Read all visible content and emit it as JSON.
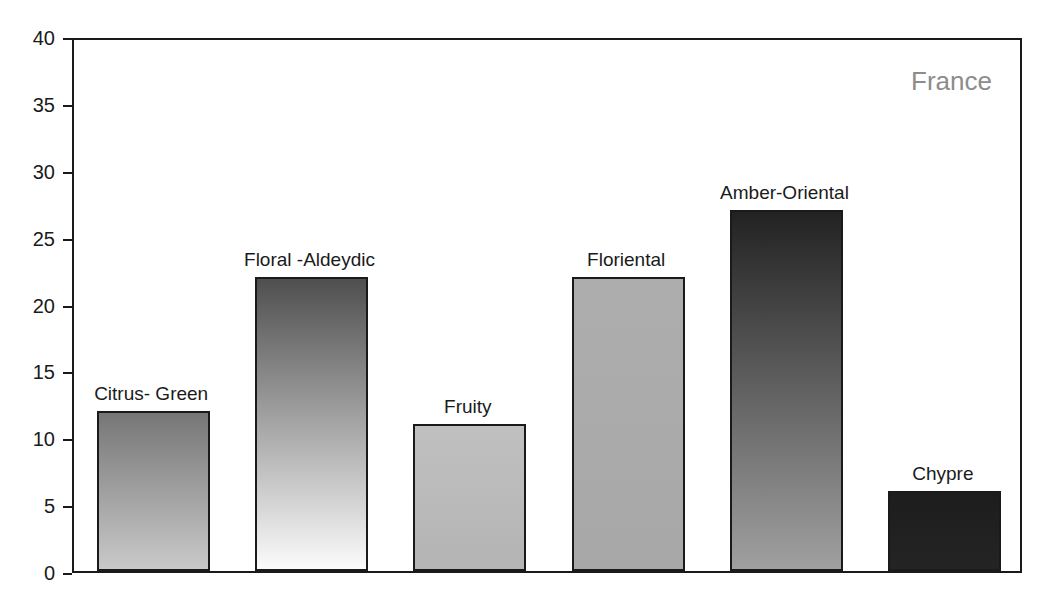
{
  "chart_data": {
    "type": "bar",
    "title": "",
    "subtitle": "",
    "annotation": "France",
    "xlabel": "",
    "ylabel": "",
    "ylim": [
      0,
      40
    ],
    "yticks": [
      0,
      5,
      10,
      15,
      20,
      25,
      30,
      35,
      40
    ],
    "ytick_labels": [
      "0",
      "5",
      "10",
      "15",
      "20",
      "25",
      "30",
      "35",
      "40"
    ],
    "grid": false,
    "legend": "none",
    "categories": [
      "Citrus- Green",
      "Floral -Aldeydic",
      "Fruity",
      "Floriental",
      "Amber-Oriental",
      "Chypre"
    ],
    "values": [
      12,
      22,
      11,
      22,
      27,
      6
    ],
    "bars": [
      {
        "label": "Citrus- Green",
        "value": 12,
        "fill_top": "#767676",
        "fill_bottom": "#c9c9c9",
        "edge": "#1a1a1a"
      },
      {
        "label": "Floral -Aldeydic",
        "value": 22,
        "fill_top": "#4f4f4f",
        "fill_bottom": "#fbfbfb",
        "edge": "#1a1a1a"
      },
      {
        "label": "Fruity",
        "value": 11,
        "fill_top": "#c0c0c0",
        "fill_bottom": "#b4b4b4",
        "edge": "#1a1a1a"
      },
      {
        "label": "Floriental",
        "value": 22,
        "fill_top": "#adadad",
        "fill_bottom": "#a8a8a8",
        "edge": "#1a1a1a"
      },
      {
        "label": "Amber-Oriental",
        "value": 27,
        "fill_top": "#222222",
        "fill_bottom": "#a0a0a0",
        "edge": "#1a1a1a"
      },
      {
        "label": "Chypre",
        "value": 6,
        "fill_top": "#1d1d1d",
        "fill_bottom": "#242424",
        "edge": "#1a1a1a"
      }
    ]
  },
  "colors": {
    "axis": "#1a1a1a",
    "text": "#1a1a1a",
    "annotation": "#8c8c8c",
    "background": "#ffffff"
  }
}
